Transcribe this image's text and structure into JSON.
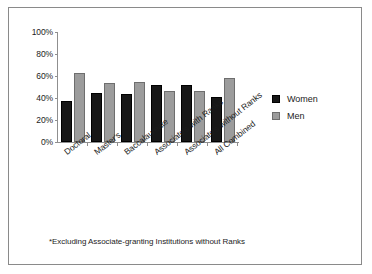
{
  "figure": {
    "footnote": "*Excluding Associate-granting Institutions without Ranks",
    "border_color": "#8a8a8a",
    "background": "#ffffff"
  },
  "legend": {
    "position": "right",
    "entries": [
      {
        "label": "Women",
        "color": "#171717"
      },
      {
        "label": "Men",
        "color": "#9c9c9c"
      }
    ]
  },
  "chart_data": {
    "type": "bar",
    "title": "",
    "subtitle": "",
    "xlabel": "",
    "ylabel": "",
    "ylim": [
      0,
      100
    ],
    "yticks": [
      "0%",
      "20%",
      "40%",
      "60%",
      "80%",
      "100%"
    ],
    "ytick_values": [
      0,
      20,
      40,
      60,
      80,
      100
    ],
    "grid": false,
    "categories": [
      "Doctoral",
      "Master's",
      "Baccalaureate",
      "Associate's with Ranks",
      "Associate's without Ranks",
      "All Combined"
    ],
    "series": [
      {
        "name": "Women",
        "color": "#171717",
        "values": [
          37,
          45,
          44,
          52,
          52,
          41
        ]
      },
      {
        "name": "Men",
        "color": "#9c9c9c",
        "values": [
          63,
          54,
          55,
          46,
          46,
          58
        ]
      }
    ],
    "annotations": [
      "*Excluding Associate-granting Institutions without Ranks"
    ]
  }
}
